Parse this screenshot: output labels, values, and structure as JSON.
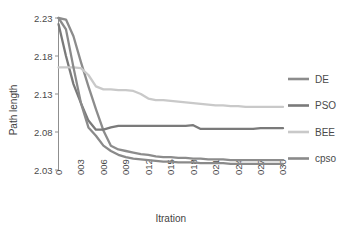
{
  "chart_data": {
    "type": "line",
    "title": "",
    "xlabel": "Itration",
    "ylabel": "Path length",
    "xlim": [
      0,
      30
    ],
    "ylim": [
      2.03,
      2.23
    ],
    "grid": false,
    "legend_position": "right",
    "x_tick_labels": [
      "0",
      "003",
      "006",
      "009",
      "012",
      "015",
      "018",
      "021",
      "024",
      "027",
      "030"
    ],
    "x_tick_values": [
      0,
      3,
      6,
      9,
      12,
      15,
      18,
      21,
      24,
      27,
      30
    ],
    "y_tick_labels": [
      "2.23",
      "2.18",
      "2.13",
      "2.08",
      "2.03"
    ],
    "y_tick_values": [
      2.23,
      2.18,
      2.13,
      2.08,
      2.03
    ],
    "x": [
      0,
      1,
      2,
      3,
      4,
      5,
      6,
      7,
      8,
      9,
      10,
      11,
      12,
      13,
      14,
      15,
      16,
      17,
      18,
      19,
      20,
      21,
      22,
      23,
      24,
      25,
      26,
      27,
      28,
      29,
      30
    ],
    "series": [
      {
        "name": "DE",
        "color": "#8c8c8c",
        "values": [
          2.23,
          2.228,
          2.206,
          2.172,
          2.14,
          2.11,
          2.082,
          2.062,
          2.057,
          2.055,
          2.053,
          2.051,
          2.05,
          2.048,
          2.047,
          2.047,
          2.046,
          2.046,
          2.045,
          2.045,
          2.044,
          2.044,
          2.044,
          2.043,
          2.043,
          2.043,
          2.043,
          2.043,
          2.043,
          2.043,
          2.043
        ]
      },
      {
        "name": "PSO",
        "color": "#7a7a7a",
        "values": [
          2.222,
          2.18,
          2.143,
          2.118,
          2.095,
          2.083,
          2.083,
          2.086,
          2.088,
          2.088,
          2.088,
          2.088,
          2.088,
          2.088,
          2.088,
          2.088,
          2.088,
          2.088,
          2.089,
          2.084,
          2.084,
          2.084,
          2.084,
          2.084,
          2.084,
          2.084,
          2.084,
          2.085,
          2.085,
          2.085,
          2.085
        ]
      },
      {
        "name": "BEE",
        "color": "#c9c9c9",
        "values": [
          2.165,
          2.165,
          2.165,
          2.164,
          2.155,
          2.14,
          2.136,
          2.136,
          2.135,
          2.135,
          2.134,
          2.13,
          2.124,
          2.122,
          2.122,
          2.121,
          2.12,
          2.119,
          2.118,
          2.117,
          2.116,
          2.115,
          2.115,
          2.114,
          2.114,
          2.113,
          2.113,
          2.113,
          2.113,
          2.113,
          2.113
        ]
      },
      {
        "name": "cpso",
        "color": "#8a8a8a",
        "values": [
          2.23,
          2.215,
          2.165,
          2.118,
          2.086,
          2.075,
          2.062,
          2.055,
          2.05,
          2.047,
          2.045,
          2.044,
          2.043,
          2.042,
          2.041,
          2.041,
          2.04,
          2.04,
          2.04,
          2.039,
          2.039,
          2.039,
          2.039,
          2.038,
          2.038,
          2.038,
          2.038,
          2.038,
          2.038,
          2.038,
          2.038
        ]
      }
    ]
  },
  "legend": {
    "entries": [
      {
        "label": "DE",
        "color": "#8c8c8c"
      },
      {
        "label": "PSO",
        "color": "#7a7a7a"
      },
      {
        "label": "BEE",
        "color": "#c9c9c9"
      },
      {
        "label": "cpso",
        "color": "#8a8a8a"
      }
    ]
  },
  "axes": {
    "y_title": "Path length",
    "x_title": "Itration"
  }
}
